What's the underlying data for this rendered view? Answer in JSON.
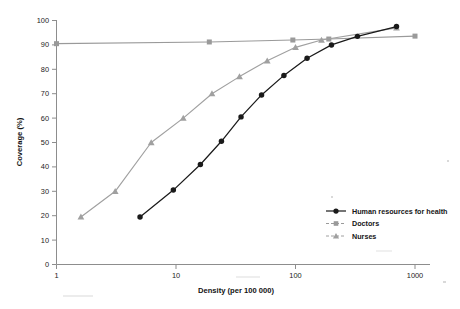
{
  "chart_data": {
    "type": "line",
    "title": "",
    "subtitle": "",
    "xlabel": "Density (per 100 000)",
    "ylabel": "Coverage (%)",
    "xscale": "log",
    "xlim": [
      1,
      1000
    ],
    "ylim": [
      0,
      100
    ],
    "xticks": [
      "1",
      "10",
      "100",
      "1000"
    ],
    "xtick_values": [
      1,
      10,
      100,
      1000
    ],
    "yticks": [
      "0",
      "10",
      "20",
      "30",
      "40",
      "50",
      "60",
      "70",
      "80",
      "90",
      "100"
    ],
    "ytick_values": [
      0,
      10,
      20,
      30,
      40,
      50,
      60,
      70,
      80,
      90,
      100
    ],
    "grid": false,
    "legend_position": "bottom-right",
    "series": [
      {
        "name": "Human resources for health",
        "marker": "circle",
        "color": "#1a1a1a",
        "x": [
          5.0,
          9.5,
          16.0,
          24.0,
          35.0,
          52.0,
          80.0,
          125.0,
          200.0,
          330.0,
          700.0
        ],
        "y": [
          19.5,
          30.5,
          41.0,
          50.5,
          60.5,
          69.5,
          77.5,
          84.5,
          90.0,
          93.5,
          97.5
        ]
      },
      {
        "name": "Doctors",
        "marker": "square",
        "color": "#9a9a9a",
        "x": [
          1.0,
          19.0,
          95.0,
          190.0,
          1000.0
        ],
        "y": [
          90.5,
          91.2,
          92.0,
          92.4,
          93.6
        ]
      },
      {
        "name": "Nurses",
        "marker": "triangle",
        "color": "#a0a0a0",
        "x": [
          1.6,
          3.1,
          6.2,
          11.5,
          20.0,
          34.0,
          58.0,
          100.0,
          165.0,
          700.0
        ],
        "y": [
          19.5,
          30.0,
          50.0,
          60.0,
          70.0,
          77.0,
          83.5,
          89.0,
          92.0,
          97.0
        ]
      }
    ]
  },
  "legend": {
    "items": [
      {
        "label": "Human resources for health",
        "marker": "circle",
        "color": "#1a1a1a"
      },
      {
        "label": "Doctors",
        "marker": "square",
        "color": "#9a9a9a"
      },
      {
        "label": "Nurses",
        "marker": "triangle",
        "color": "#a0a0a0"
      }
    ]
  },
  "axes": {
    "x_title": "Density (per 100 000)",
    "y_title": "Coverage (%)"
  },
  "ticks": {
    "x": [
      "1",
      "10",
      "100",
      "1000"
    ],
    "y": [
      "100",
      "90",
      "80",
      "70",
      "60",
      "50",
      "40",
      "30",
      "20",
      "10",
      "0"
    ]
  }
}
